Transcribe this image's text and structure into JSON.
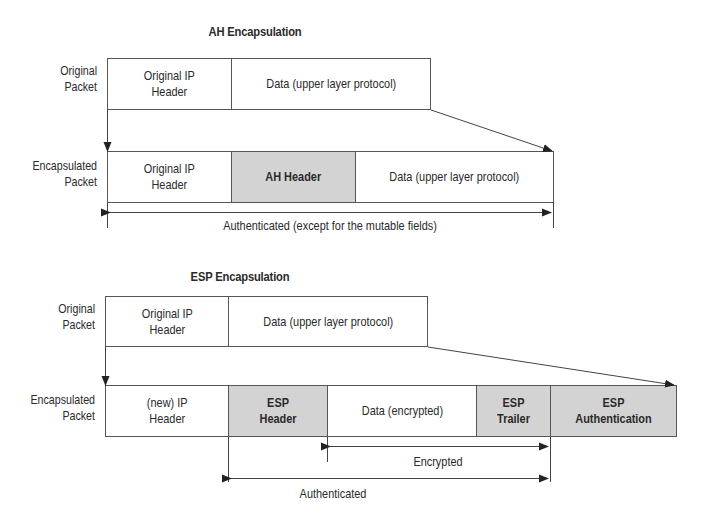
{
  "ah": {
    "title": "AH Encapsulation",
    "original": {
      "label": "Original\nPacket",
      "label_lines": [
        "Original",
        "Packet"
      ],
      "fields": [
        {
          "lines": [
            "Original IP",
            "Header"
          ],
          "shaded": false
        },
        {
          "lines": [
            "Data (upper layer protocol)"
          ],
          "shaded": false
        }
      ]
    },
    "encapsulated": {
      "label_lines": [
        "Encapsulated",
        "Packet"
      ],
      "fields": [
        {
          "lines": [
            "Original IP",
            "Header"
          ],
          "shaded": false
        },
        {
          "lines": [
            "AH Header"
          ],
          "shaded": true
        },
        {
          "lines": [
            "Data (upper layer protocol)"
          ],
          "shaded": false
        }
      ]
    },
    "span_label": "Authenticated (except for the mutable fields)"
  },
  "esp": {
    "title": "ESP Encapsulation",
    "original": {
      "label_lines": [
        "Original",
        "Packet"
      ],
      "fields": [
        {
          "lines": [
            "Original IP",
            "Header"
          ],
          "shaded": false
        },
        {
          "lines": [
            "Data (upper layer protocol)"
          ],
          "shaded": false
        }
      ]
    },
    "encapsulated": {
      "label_lines": [
        "Encapsulated",
        "Packet"
      ],
      "fields": [
        {
          "lines": [
            "(new) IP",
            "Header"
          ],
          "shaded": false
        },
        {
          "lines": [
            "ESP",
            "Header"
          ],
          "shaded": true
        },
        {
          "lines": [
            "Data (encrypted)"
          ],
          "shaded": false
        },
        {
          "lines": [
            "ESP",
            "Trailer"
          ],
          "shaded": true
        },
        {
          "lines": [
            "ESP",
            "Authentication"
          ],
          "shaded": true
        }
      ]
    },
    "encrypted_label": "Encrypted",
    "authenticated_label": "Authenticated"
  },
  "colors": {
    "shaded_field": "#d3d3d3",
    "line": "#333333",
    "text": "#2a2a2a"
  }
}
